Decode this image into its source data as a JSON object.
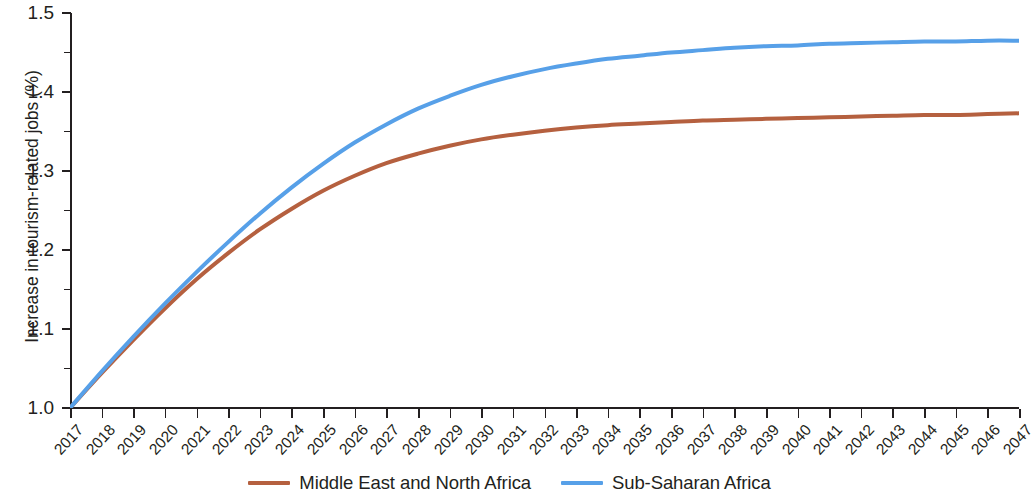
{
  "chart_data": {
    "type": "line",
    "title": "",
    "xlabel": "",
    "ylabel": "Increase in tourism-related jobs (%)",
    "xlim": [
      2017,
      2047
    ],
    "ylim": [
      1.0,
      1.5
    ],
    "grid": false,
    "legend_position": "bottom-center",
    "y_major_step": 0.1,
    "y_minor_step": 0.05,
    "y_tick_labels": [
      "1.5",
      "1.4",
      "1.3",
      "1.2",
      "1.1",
      "1.0"
    ],
    "y_tick_values": [
      1.5,
      1.4,
      1.3,
      1.2,
      1.1,
      1.0
    ],
    "y_minor_values": [
      1.45,
      1.35,
      1.25,
      1.15,
      1.05
    ],
    "x": [
      2017,
      2018,
      2019,
      2020,
      2021,
      2022,
      2023,
      2024,
      2025,
      2026,
      2027,
      2028,
      2029,
      2030,
      2031,
      2032,
      2033,
      2034,
      2035,
      2036,
      2037,
      2038,
      2039,
      2040,
      2041,
      2042,
      2043,
      2044,
      2045,
      2046,
      2047
    ],
    "x_tick_labels": [
      "2017",
      "2018",
      "2019",
      "2020",
      "2021",
      "2022",
      "2023",
      "2024",
      "2025",
      "2026",
      "2027",
      "2028",
      "2029",
      "2030",
      "2031",
      "2032",
      "2033",
      "2034",
      "2035",
      "2036",
      "2037",
      "2038",
      "2039",
      "2040",
      "2041",
      "2042",
      "2043",
      "2044",
      "2045",
      "2046",
      "2047"
    ],
    "series": [
      {
        "name": "Middle East and North Africa",
        "color": "#b5603f",
        "values": [
          1.0,
          1.044,
          1.086,
          1.126,
          1.163,
          1.196,
          1.226,
          1.252,
          1.275,
          1.294,
          1.31,
          1.322,
          1.332,
          1.34,
          1.346,
          1.351,
          1.355,
          1.358,
          1.36,
          1.362,
          1.364,
          1.365,
          1.366,
          1.367,
          1.368,
          1.369,
          1.37,
          1.371,
          1.371,
          1.372,
          1.373
        ]
      },
      {
        "name": "Sub-Saharan Africa",
        "color": "#57a0e8",
        "values": [
          1.0,
          1.046,
          1.09,
          1.132,
          1.172,
          1.21,
          1.246,
          1.279,
          1.309,
          1.336,
          1.359,
          1.379,
          1.395,
          1.409,
          1.42,
          1.429,
          1.436,
          1.442,
          1.446,
          1.45,
          1.453,
          1.456,
          1.458,
          1.459,
          1.461,
          1.462,
          1.463,
          1.464,
          1.464,
          1.465,
          1.465
        ]
      }
    ]
  },
  "legend": {
    "entries": [
      {
        "label": "Middle East and North Africa",
        "color": "#b5603f"
      },
      {
        "label": "Sub-Saharan Africa",
        "color": "#57a0e8"
      }
    ]
  },
  "axes": {
    "y_title": "Increase in tourism-related jobs (%)"
  }
}
